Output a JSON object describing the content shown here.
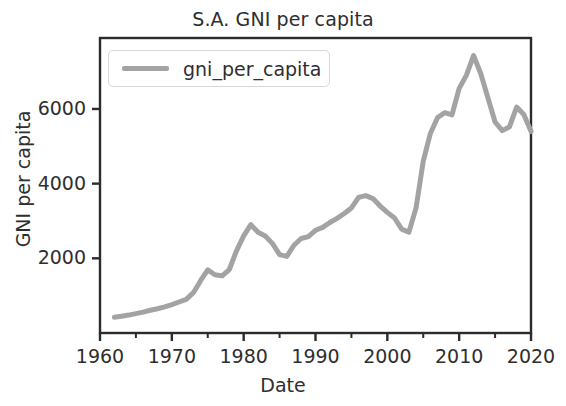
{
  "figure": {
    "width": 566,
    "height": 406,
    "background": "#ffffff"
  },
  "axes": {
    "left": 100,
    "top": 38,
    "right": 531,
    "bottom": 333,
    "spine_color": "#2b2b2b",
    "tick_color": "#2b2b2b"
  },
  "chart_data": {
    "type": "line",
    "title": "S.A. GNI per capita",
    "xlabel": "Date",
    "ylabel": "GNI per capita",
    "grid": false,
    "legend_position": "upper left",
    "xlim": [
      1960,
      2020
    ],
    "ylim": [
      0,
      7900
    ],
    "xticks": [
      1960,
      1970,
      1980,
      1990,
      2000,
      2010,
      2020
    ],
    "xtick_labels": [
      "1960",
      "1970",
      "1980",
      "1990",
      "2000",
      "2010",
      "2020"
    ],
    "xminor_ticks": [
      1965,
      1975,
      1985,
      1995,
      2005,
      2015
    ],
    "yticks": [
      2000,
      4000,
      6000
    ],
    "ytick_labels": [
      "2000",
      "4000",
      "6000"
    ],
    "series": [
      {
        "name": "gni_per_capita",
        "color": "#a3a3a3",
        "linewidth": 5,
        "x": [
          1962,
          1963,
          1964,
          1965,
          1966,
          1967,
          1968,
          1969,
          1970,
          1971,
          1972,
          1973,
          1974,
          1975,
          1976,
          1977,
          1978,
          1979,
          1980,
          1981,
          1982,
          1983,
          1984,
          1985,
          1986,
          1987,
          1988,
          1989,
          1990,
          1991,
          1992,
          1993,
          1994,
          1995,
          1996,
          1997,
          1998,
          1999,
          2000,
          2001,
          2002,
          2003,
          2004,
          2005,
          2006,
          2007,
          2008,
          2009,
          2010,
          2011,
          2012,
          2013,
          2014,
          2015,
          2016,
          2017,
          2018,
          2019,
          2020
        ],
        "y": [
          420,
          450,
          480,
          520,
          560,
          610,
          650,
          700,
          760,
          830,
          900,
          1080,
          1400,
          1690,
          1560,
          1530,
          1700,
          2200,
          2600,
          2900,
          2700,
          2600,
          2400,
          2100,
          2050,
          2350,
          2530,
          2580,
          2750,
          2830,
          2960,
          3070,
          3200,
          3350,
          3630,
          3680,
          3600,
          3400,
          3230,
          3080,
          2780,
          2700,
          3350,
          4600,
          5350,
          5770,
          5900,
          5840,
          6550,
          6900,
          7430,
          6950,
          6300,
          5650,
          5420,
          5520,
          6050,
          5850,
          5400
        ]
      }
    ]
  },
  "legend": {
    "entries": [
      {
        "label": "gni_per_capita",
        "color": "#a3a3a3"
      }
    ]
  }
}
